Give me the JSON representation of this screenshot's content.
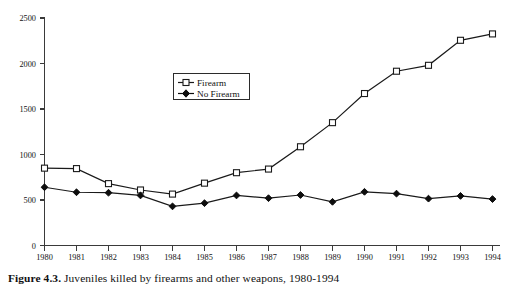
{
  "caption": {
    "label": "Figure 4.3.",
    "text": "Juveniles killed by firearms and other weapons, 1980-1994"
  },
  "legend": {
    "entries": [
      {
        "label": "Firearm",
        "marker": "open-square",
        "color": "#1a1a1a"
      },
      {
        "label": "No Firearm",
        "marker": "filled-diamond",
        "color": "#0d0d0d"
      }
    ]
  },
  "axes": {
    "y_ticks": [
      "0",
      "500",
      "1000",
      "1500",
      "2000",
      "2500"
    ],
    "x_ticks": [
      "1980",
      "1981",
      "1982",
      "1983",
      "1984",
      "1985",
      "1986",
      "1987",
      "1988",
      "1989",
      "1990",
      "1991",
      "1992",
      "1993",
      "1994"
    ]
  },
  "chart_data": {
    "type": "line",
    "title": "Juveniles killed by firearms and other weapons, 1980-1994",
    "xlabel": "",
    "ylabel": "",
    "x": [
      1980,
      1981,
      1982,
      1983,
      1984,
      1985,
      1986,
      1987,
      1988,
      1989,
      1990,
      1991,
      1992,
      1993,
      1994
    ],
    "categories": [
      "1980",
      "1981",
      "1982",
      "1983",
      "1984",
      "1985",
      "1986",
      "1987",
      "1988",
      "1989",
      "1990",
      "1991",
      "1992",
      "1993",
      "1994"
    ],
    "series": [
      {
        "name": "Firearm",
        "marker": "open-square",
        "color": "#1a1a1a",
        "values": [
          850,
          845,
          680,
          610,
          565,
          685,
          800,
          840,
          1085,
          1350,
          1670,
          1915,
          1980,
          2255,
          2325
        ]
      },
      {
        "name": "No Firearm",
        "marker": "filled-diamond",
        "color": "#0d0d0d",
        "values": [
          640,
          585,
          580,
          550,
          430,
          465,
          550,
          520,
          555,
          480,
          590,
          570,
          515,
          545,
          510
        ]
      }
    ],
    "ylim": [
      0,
      2500
    ],
    "ytick_step": 500,
    "grid": false,
    "legend_position": "upper-center-left"
  }
}
